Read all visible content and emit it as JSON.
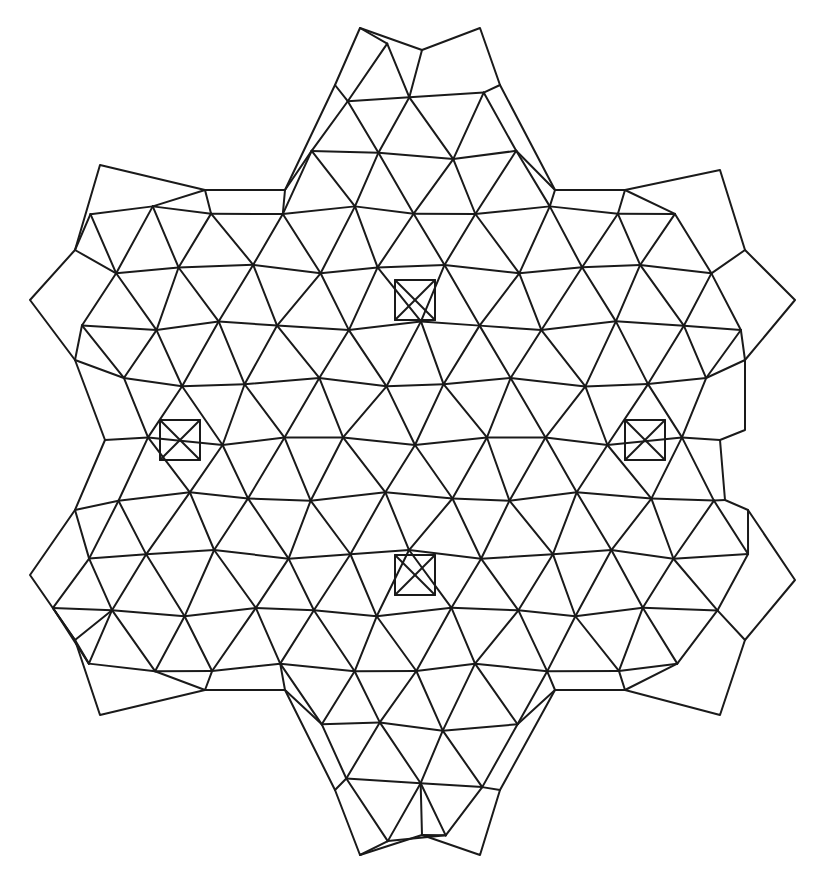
{
  "figure": {
    "stroke_color": "#1a1a1a",
    "background": "#ffffff",
    "symmetry": "6-fold",
    "squares_centers": [
      [
        415,
        300
      ],
      [
        180,
        440
      ],
      [
        645,
        440
      ],
      [
        415,
        575
      ]
    ],
    "outline": [
      [
        360,
        28
      ],
      [
        422,
        50
      ],
      [
        480,
        28
      ],
      [
        500,
        85
      ],
      [
        555,
        190
      ],
      [
        625,
        190
      ],
      [
        720,
        170
      ],
      [
        745,
        250
      ],
      [
        795,
        300
      ],
      [
        745,
        360
      ],
      [
        745,
        430
      ],
      [
        720,
        440
      ],
      [
        725,
        500
      ],
      [
        748,
        510
      ],
      [
        795,
        580
      ],
      [
        745,
        640
      ],
      [
        720,
        715
      ],
      [
        625,
        690
      ],
      [
        555,
        690
      ],
      [
        500,
        790
      ],
      [
        480,
        855
      ],
      [
        422,
        835
      ],
      [
        360,
        855
      ],
      [
        335,
        790
      ],
      [
        285,
        690
      ],
      [
        205,
        690
      ],
      [
        100,
        715
      ],
      [
        75,
        640
      ],
      [
        30,
        575
      ],
      [
        75,
        510
      ],
      [
        105,
        440
      ],
      [
        75,
        360
      ],
      [
        30,
        300
      ],
      [
        75,
        250
      ],
      [
        100,
        165
      ],
      [
        205,
        190
      ],
      [
        285,
        190
      ],
      [
        335,
        85
      ]
    ]
  }
}
